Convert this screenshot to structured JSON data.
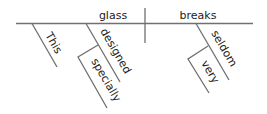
{
  "diagram": {
    "type": "sentence-diagram",
    "subject": "glass",
    "predicate": "breaks",
    "modifiers": {
      "subject": [
        "This",
        "designed"
      ],
      "designed": [
        "specially"
      ],
      "predicate": [
        "seldom"
      ],
      "seldom": [
        "very"
      ]
    },
    "words": {
      "subject": "glass",
      "predicate": "breaks",
      "this": "This",
      "designed": "designed",
      "specially": "specially",
      "seldom": "seldom",
      "very": "very"
    },
    "colors": {
      "line": "#707070",
      "text": "#222222"
    }
  }
}
